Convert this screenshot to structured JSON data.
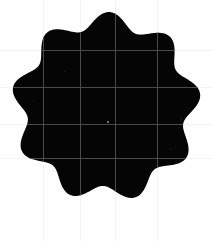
{
  "canvas": {
    "width": 213,
    "height": 241,
    "background_color": "#ffffff"
  },
  "figure": {
    "name": "scalloped-blob",
    "fill_color": "#050505",
    "center_x": 106,
    "center_y": 107,
    "outer_radius": 95,
    "inner_radius": 79,
    "lobe_count": 9,
    "lobe_phase_deg": -8,
    "bounds": {
      "left": 12,
      "right": 201,
      "top": 11,
      "bottom": 201
    }
  },
  "grid": {
    "visible": true,
    "line_color_over_blob": "#4a4a4a",
    "line_color_over_background": "#f4f4f4",
    "line_width": 1,
    "vertical_lines": [
      43,
      80,
      115,
      157
    ],
    "horizontal_lines": [
      50,
      87,
      124,
      158
    ]
  },
  "center_marker": {
    "visible": true,
    "x": 107,
    "y": 121,
    "size": 2,
    "color": "#6e6e6e"
  },
  "speckles": [
    {
      "x": 181,
      "y": 118,
      "size": 1,
      "color": "#3a3a3a"
    },
    {
      "x": 170,
      "y": 149,
      "size": 1,
      "color": "#2e2e2e"
    },
    {
      "x": 33,
      "y": 101,
      "size": 1,
      "color": "#2a2a2a"
    },
    {
      "x": 150,
      "y": 172,
      "size": 1,
      "color": "#262626"
    },
    {
      "x": 64,
      "y": 71,
      "size": 1,
      "color": "#232323"
    }
  ]
}
